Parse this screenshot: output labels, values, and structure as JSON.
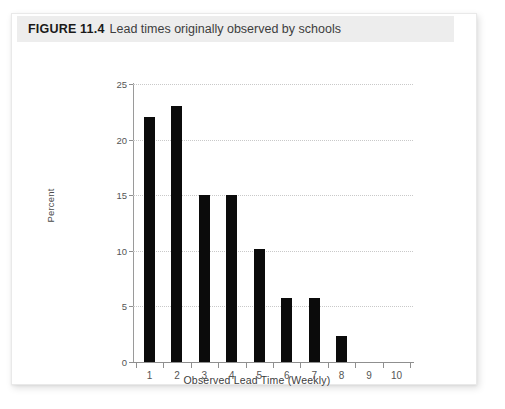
{
  "caption": {
    "figure_number": "FIGURE 11.4",
    "text": "Lead times originally observed by schools"
  },
  "chart_data": {
    "type": "bar",
    "title": "Lead times originally observed by schools",
    "xlabel": "Observed Lead Time (Weekly)",
    "ylabel": "Percent",
    "categories": [
      "1",
      "2",
      "3",
      "4",
      "5",
      "6",
      "7",
      "8",
      "9",
      "10"
    ],
    "values": [
      22,
      23,
      15,
      15,
      10.2,
      5.8,
      5.8,
      2.3,
      0,
      0
    ],
    "xlim": [
      0.4,
      10.6
    ],
    "ylim": [
      0,
      25
    ],
    "yticks": [
      0,
      5,
      10,
      15,
      20,
      25
    ],
    "ytick_labels": [
      "0",
      "5",
      "10",
      "15",
      "20",
      "25"
    ],
    "xticks": [
      1,
      2,
      3,
      4,
      5,
      6,
      7,
      8,
      9,
      10
    ],
    "xtick_labels": [
      "1",
      "2",
      "3",
      "4",
      "5",
      "6",
      "7",
      "8",
      "9",
      "10"
    ],
    "grid": "horizontal-dotted",
    "legend": "none",
    "bar_color": "#0b0b0b",
    "grid_color": "#c9c9c9",
    "axis_color": "#8f8f8f"
  }
}
